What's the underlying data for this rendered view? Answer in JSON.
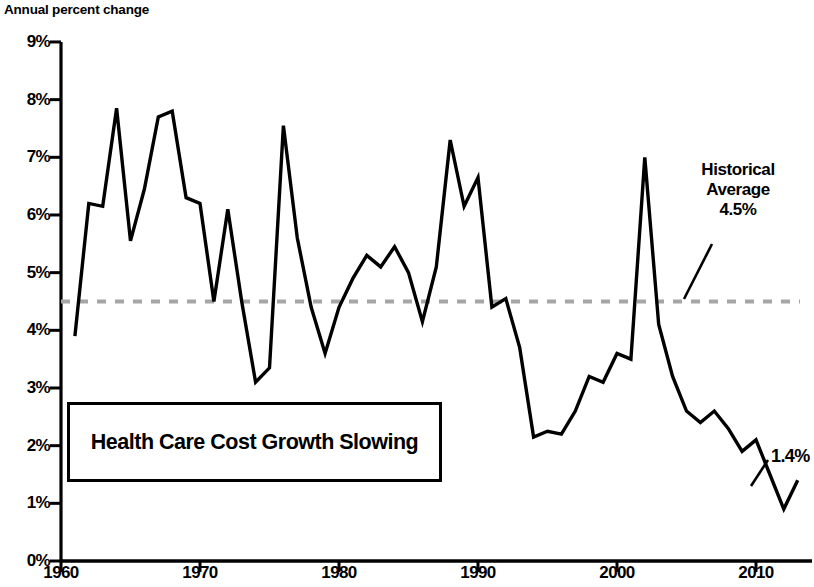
{
  "axis": {
    "y_axis_label": "Annual percent change",
    "y_ticks": [
      "0%",
      "1%",
      "2%",
      "3%",
      "4%",
      "5%",
      "6%",
      "7%",
      "8%",
      "9%"
    ],
    "x_ticks": [
      "1960",
      "1970",
      "1980",
      "1990",
      "2000",
      "2010"
    ]
  },
  "annotations": {
    "historical_average_line1": "Historical",
    "historical_average_line2": "Average",
    "historical_average_value": "4.5%",
    "caption": "Health Care Cost Growth Slowing",
    "endpoint_value": "1.4%"
  },
  "colors": {
    "line": "#000000",
    "average_line": "#a6a6a6",
    "axis": "#000000",
    "background": "#ffffff",
    "box_border": "#000000"
  },
  "chart_data": {
    "type": "line",
    "title": "Health Care Cost Growth Slowing",
    "xlabel": "",
    "ylabel": "Annual percent change",
    "xlim": [
      1960,
      2014
    ],
    "ylim": [
      0,
      9
    ],
    "grid": false,
    "legend": "none",
    "x_tick_values": [
      1960,
      1970,
      1980,
      1990,
      2000,
      2010
    ],
    "y_tick_values": [
      0,
      1,
      2,
      3,
      4,
      5,
      6,
      7,
      8,
      9
    ],
    "reference_line": {
      "label": "Historical Average",
      "value": 4.5,
      "style": "dashed",
      "color": "#a6a6a6"
    },
    "series": [
      {
        "name": "Health care cost growth",
        "x": [
          1961,
          1962,
          1963,
          1964,
          1965,
          1966,
          1967,
          1968,
          1969,
          1970,
          1971,
          1972,
          1973,
          1974,
          1975,
          1976,
          1977,
          1978,
          1979,
          1980,
          1981,
          1982,
          1983,
          1984,
          1985,
          1986,
          1987,
          1988,
          1989,
          1990,
          1991,
          1992,
          1993,
          1994,
          1995,
          1996,
          1997,
          1998,
          1999,
          2000,
          2001,
          2002,
          2003,
          2004,
          2005,
          2006,
          2007,
          2008,
          2009,
          2010,
          2011,
          2012,
          2013
        ],
        "values": [
          3.9,
          6.2,
          6.15,
          7.85,
          5.55,
          6.45,
          7.7,
          7.8,
          6.3,
          6.2,
          4.5,
          6.1,
          4.5,
          3.1,
          3.35,
          7.55,
          5.6,
          4.4,
          3.6,
          4.4,
          4.9,
          5.3,
          5.1,
          5.45,
          5.0,
          4.15,
          5.1,
          7.3,
          6.15,
          6.65,
          4.4,
          4.55,
          3.7,
          2.15,
          2.25,
          2.2,
          2.6,
          3.2,
          3.1,
          3.6,
          3.5,
          7.0,
          4.1,
          3.2,
          2.6,
          2.4,
          2.6,
          2.3,
          1.9,
          2.1,
          1.5,
          0.9,
          1.4
        ]
      }
    ],
    "point_labels": [
      {
        "x": 2013,
        "value": 1.4,
        "text": "1.4%"
      }
    ]
  }
}
